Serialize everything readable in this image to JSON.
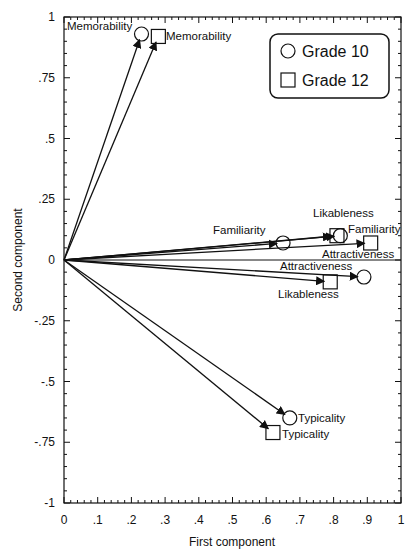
{
  "chart_data": {
    "type": "scatter",
    "subtype": "biplot-vectors",
    "title": "",
    "xlabel": "First component",
    "ylabel": "Second component",
    "xlim": [
      0,
      1
    ],
    "ylim": [
      -1,
      1
    ],
    "x_ticks": [
      "0",
      ".1",
      ".2",
      ".3",
      ".4",
      ".5",
      ".6",
      ".7",
      ".8",
      ".9",
      "1"
    ],
    "y_ticks": [
      "1",
      ".75",
      ".5",
      ".25",
      "0",
      "-.25",
      "-.5",
      "-.75",
      "-1"
    ],
    "grid": false,
    "zero_line": true,
    "legend_position": "top-right",
    "series": [
      {
        "name": "Grade 10",
        "marker": "circle",
        "points": [
          {
            "label": "Memorability",
            "x": 0.23,
            "y": 0.93
          },
          {
            "label": "Familiarity",
            "x": 0.65,
            "y": 0.07
          },
          {
            "label": "Likableness",
            "x": 0.82,
            "y": 0.1
          },
          {
            "label": "Attractiveness",
            "x": 0.89,
            "y": -0.07
          },
          {
            "label": "Typicality",
            "x": 0.67,
            "y": -0.65
          }
        ]
      },
      {
        "name": "Grade 12",
        "marker": "square",
        "points": [
          {
            "label": "Memorability",
            "x": 0.28,
            "y": 0.92
          },
          {
            "label": "Familiarity",
            "x": 0.81,
            "y": 0.1
          },
          {
            "label": "Attractiveness",
            "x": 0.91,
            "y": 0.07
          },
          {
            "label": "Likableness",
            "x": 0.79,
            "y": -0.09
          },
          {
            "label": "Typicality",
            "x": 0.62,
            "y": -0.71
          }
        ]
      }
    ]
  },
  "legend": {
    "items": [
      {
        "label": "Grade 10",
        "marker": "circle"
      },
      {
        "label": "Grade 12",
        "marker": "square"
      }
    ]
  },
  "labels": {
    "mem10": "Memorability",
    "mem12": "Memorability",
    "fam10": "Familiarity",
    "lik10": "Likableness",
    "fam12": "Familiarity",
    "att12": "Attractiveness",
    "att10": "Attractiveness",
    "lik12": "Likableness",
    "typ10": "Typicality",
    "typ12": "Typicality"
  },
  "colors": {
    "ink": "#111111",
    "background": "#ffffff"
  }
}
